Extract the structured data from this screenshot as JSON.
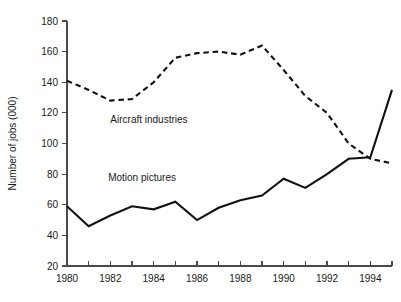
{
  "chart_data": {
    "type": "line",
    "title": "",
    "subtitle": "",
    "xlabel": "",
    "ylabel": "Number of jobs (000)",
    "xlim": [
      1980,
      1995
    ],
    "ylim": [
      20,
      180
    ],
    "ytick_step": 20,
    "xtick_step": 1,
    "xtick_label_step": 2,
    "grid": false,
    "legend": "inline-annotations",
    "x": [
      1980,
      1981,
      1982,
      1983,
      1984,
      1985,
      1986,
      1987,
      1988,
      1989,
      1990,
      1991,
      1992,
      1993,
      1994,
      1995
    ],
    "xtick_labels": [
      "1980",
      "",
      "1982",
      "",
      "1984",
      "",
      "1986",
      "",
      "1988",
      "",
      "1990",
      "",
      "1992",
      "",
      "1994",
      ""
    ],
    "ytick_labels": [
      "20",
      "40",
      "60",
      "80",
      "100",
      "120",
      "140",
      "160",
      "180"
    ],
    "ytick_values": [
      20,
      40,
      60,
      80,
      100,
      120,
      140,
      160,
      180
    ],
    "series": [
      {
        "name": "Aircraft industries",
        "style": "dashed",
        "color": "#111111",
        "label_x": 1982.0,
        "label_y": 116,
        "values": [
          141,
          135,
          128,
          129,
          140,
          156,
          159,
          160,
          158,
          164,
          148,
          131,
          120,
          100,
          90,
          87
        ]
      },
      {
        "name": "Motion pictures",
        "style": "solid",
        "color": "#111111",
        "label_x": 1981.9,
        "label_y": 78,
        "values": [
          59,
          46,
          53,
          59,
          57,
          62,
          50,
          58,
          63,
          66,
          77,
          71,
          80,
          90,
          91,
          135
        ]
      }
    ],
    "annotations": [
      {
        "text": "Aircraft industries",
        "x": 1982.0,
        "y": 116
      },
      {
        "text": "Motion pictures",
        "x": 1981.9,
        "y": 78
      }
    ]
  },
  "axes": {
    "y_axis_title": "Number of jobs (000)"
  },
  "colors": {
    "background": "#ffffff",
    "ink": "#111111",
    "axis": "#4a4a4a"
  }
}
